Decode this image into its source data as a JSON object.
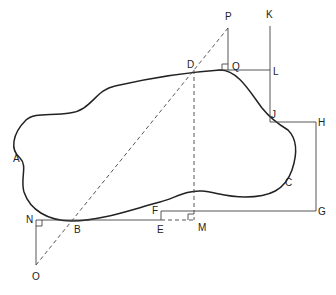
{
  "diagram": {
    "type": "geometric-construction",
    "labels": {
      "P": "P",
      "Q": "Q",
      "K": "K",
      "L": "L",
      "D": "D",
      "J": "J",
      "H": "H",
      "A": "A",
      "C": "C",
      "F": "F",
      "G": "G",
      "N": "N",
      "B": "B",
      "E": "E",
      "M": "M",
      "O": "O"
    },
    "colors": {
      "stroke": "#222222",
      "thin": "#444444",
      "background": "#ffffff"
    }
  }
}
